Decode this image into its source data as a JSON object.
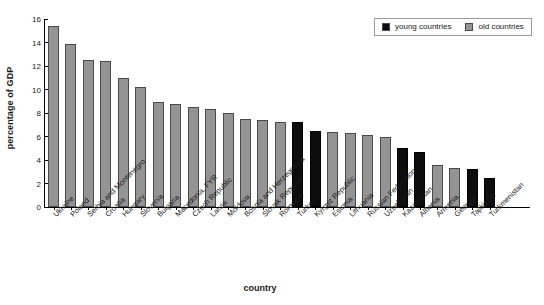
{
  "chart_data": {
    "type": "bar",
    "title": "",
    "subtitle": "",
    "xlabel": "country",
    "ylabel": "percentage of GDP",
    "ylim": [
      0,
      16
    ],
    "yticks": [
      0,
      2,
      4,
      6,
      8,
      10,
      12,
      14,
      16
    ],
    "grid": false,
    "legend_position": "top-right",
    "legend": [
      {
        "name": "young countries",
        "color": "#0d0d0d"
      },
      {
        "name": "old countries",
        "color": "#949494"
      }
    ],
    "categories": [
      "Ukraine",
      "Poland",
      "Serbia and Montenegro",
      "Croatia",
      "Hungary",
      "Slovenia",
      "Bulgaria",
      "Macedonia, FYR",
      "Czech Republic",
      "Latvia",
      "Moldova",
      "Bosnia and Herzegovina",
      "Slovak Republic",
      "Romania",
      "Turkey",
      "Kyrgyz Republic",
      "Estonia",
      "Lithuania",
      "Russian Federation",
      "Uzbekistan",
      "Kazakhstan",
      "Albania",
      "Armenia",
      "Georgia",
      "Tajikistan",
      "Turkmenistan"
    ],
    "values": [
      15.4,
      13.9,
      12.5,
      12.4,
      11.0,
      10.2,
      8.9,
      8.8,
      8.5,
      8.3,
      8.0,
      7.5,
      7.4,
      7.2,
      7.2,
      6.5,
      6.4,
      6.3,
      6.1,
      6.0,
      5.0,
      4.7,
      3.6,
      3.3,
      3.2,
      2.5
    ],
    "groups": [
      "old",
      "old",
      "old",
      "old",
      "old",
      "old",
      "old",
      "old",
      "old",
      "old",
      "old",
      "old",
      "old",
      "old",
      "young",
      "young",
      "old",
      "old",
      "old",
      "old",
      "young",
      "young",
      "old",
      "old",
      "young",
      "young"
    ]
  }
}
